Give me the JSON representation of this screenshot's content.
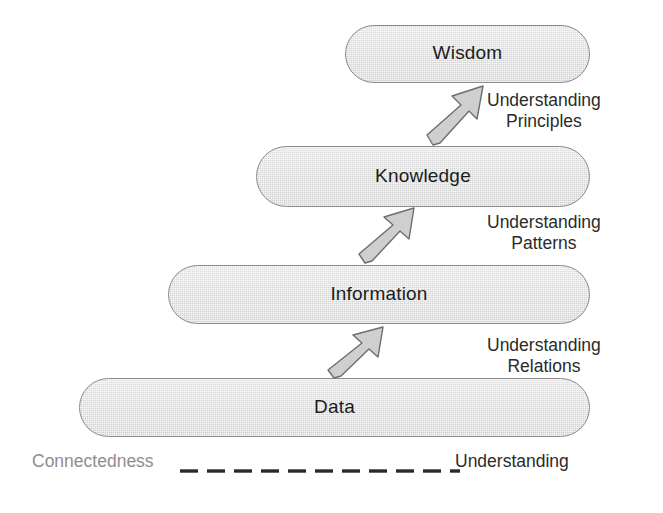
{
  "diagram": {
    "levels": [
      {
        "id": "wisdom",
        "label": "Wisdom",
        "x": 345,
        "y": 25,
        "w": 245,
        "h": 58
      },
      {
        "id": "knowledge",
        "label": "Knowledge",
        "x": 256,
        "y": 146,
        "w": 334,
        "h": 61
      },
      {
        "id": "information",
        "label": "Information",
        "x": 168,
        "y": 265,
        "w": 422,
        "h": 59
      },
      {
        "id": "data",
        "label": "Data",
        "x": 79,
        "y": 378,
        "w": 511,
        "h": 59
      }
    ],
    "arrows": [
      {
        "id": "data-to-information",
        "x": 326,
        "y": 322,
        "w": 68,
        "h": 60
      },
      {
        "id": "information-to-knowledge",
        "x": 357,
        "y": 203,
        "w": 68,
        "h": 64
      },
      {
        "id": "knowledge-to-wisdom",
        "x": 425,
        "y": 81,
        "w": 68,
        "h": 68
      }
    ],
    "notes": [
      {
        "id": "note-principles",
        "line1": "Understanding",
        "line2": "Principles",
        "x": 487,
        "y": 90
      },
      {
        "id": "note-patterns",
        "line1": "Understanding",
        "line2": "Patterns",
        "x": 487,
        "y": 212
      },
      {
        "id": "note-relations",
        "line1": "Understanding",
        "line2": "Relations",
        "x": 487,
        "y": 335
      }
    ],
    "legend": {
      "left_label": "Connectedness",
      "right_label": "Understanding",
      "dash_count": 11,
      "has_trailing_slash": true
    },
    "colors": {
      "bar_fill": "#d8d8d8",
      "bar_border": "#8a8a8a",
      "label_text": "#1c1c1c",
      "note_text": "#2b2b2b",
      "legend_left_text": "#8e8e8e",
      "legend_right_text": "#2b2b2b",
      "dash_color": "#2a2a2a",
      "arrow_fill": "#cfcfcf",
      "arrow_border": "#6e6e6e",
      "background": "#ffffff"
    }
  }
}
